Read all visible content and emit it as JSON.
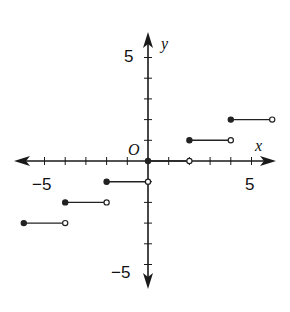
{
  "chart_data": {
    "type": "line",
    "title": "",
    "xlabel": "x",
    "ylabel": "y",
    "origin_label": "O",
    "xlim": [
      -6,
      6
    ],
    "ylim": [
      -5,
      5
    ],
    "x_tick_labels": [
      {
        "value": -5,
        "label": "−5"
      },
      {
        "value": 5,
        "label": "5"
      }
    ],
    "y_tick_labels": [
      {
        "value": 5,
        "label": "5"
      },
      {
        "value": -5,
        "label": "−5"
      }
    ],
    "grid": false,
    "legend": null,
    "segments": [
      {
        "x_start": -6,
        "x_end": -4,
        "y": -3,
        "start_closed": true,
        "end_closed": false
      },
      {
        "x_start": -4,
        "x_end": -2,
        "y": -2,
        "start_closed": true,
        "end_closed": false
      },
      {
        "x_start": -2,
        "x_end": 0,
        "y": -1,
        "start_closed": true,
        "end_closed": false
      },
      {
        "x_start": 0,
        "x_end": 2,
        "y": 0,
        "start_closed": true,
        "end_closed": false
      },
      {
        "x_start": 2,
        "x_end": 4,
        "y": 1,
        "start_closed": true,
        "end_closed": false
      },
      {
        "x_start": 4,
        "x_end": 6,
        "y": 2,
        "start_closed": true,
        "end_closed": false
      }
    ]
  },
  "style": {
    "axis_color": "#1a1a1a",
    "segment_color": "#222222",
    "background": "#ffffff"
  }
}
